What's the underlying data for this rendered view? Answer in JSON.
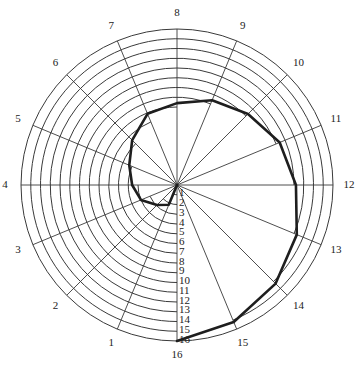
{
  "chart_data": {
    "type": "line",
    "subtype": "polar-spiral",
    "title": "",
    "angular_axis": {
      "ticks": [
        "1",
        "2",
        "3",
        "4",
        "5",
        "6",
        "7",
        "8",
        "9",
        "10",
        "11",
        "12",
        "13",
        "14",
        "15",
        "16"
      ],
      "direction": "clockwise",
      "start_position": "bottom",
      "step_degrees": 22.5
    },
    "radial_axis": {
      "range": [
        0,
        16
      ],
      "ring_count": 16,
      "ticks": [
        "1",
        "2",
        "3",
        "4",
        "5",
        "6",
        "7",
        "8",
        "9",
        "10",
        "11",
        "12",
        "13",
        "14",
        "15",
        "16"
      ],
      "label_position": "along bottom spoke",
      "ring_extent": "ring k drawn from bottom spoke clockwise up to spoke k"
    },
    "series": [
      {
        "name": "spiral",
        "start": {
          "x": 0,
          "value": 0
        },
        "x": [
          1,
          2,
          3,
          4,
          5,
          6,
          7,
          8,
          9,
          10,
          11,
          12,
          13,
          14,
          15,
          16
        ],
        "values": [
          2.2,
          2.9,
          4.0,
          4.6,
          5.3,
          6.5,
          7.9,
          8.4,
          9.4,
          10.3,
          11.4,
          12.2,
          13.3,
          14.3,
          15.2,
          16.0
        ],
        "color": "#1e1e1e"
      }
    ],
    "grid": true,
    "legend": null
  },
  "colors": {
    "background": "#ffffff",
    "grid": "#3a3a3a",
    "series": "#1e1e1e"
  }
}
